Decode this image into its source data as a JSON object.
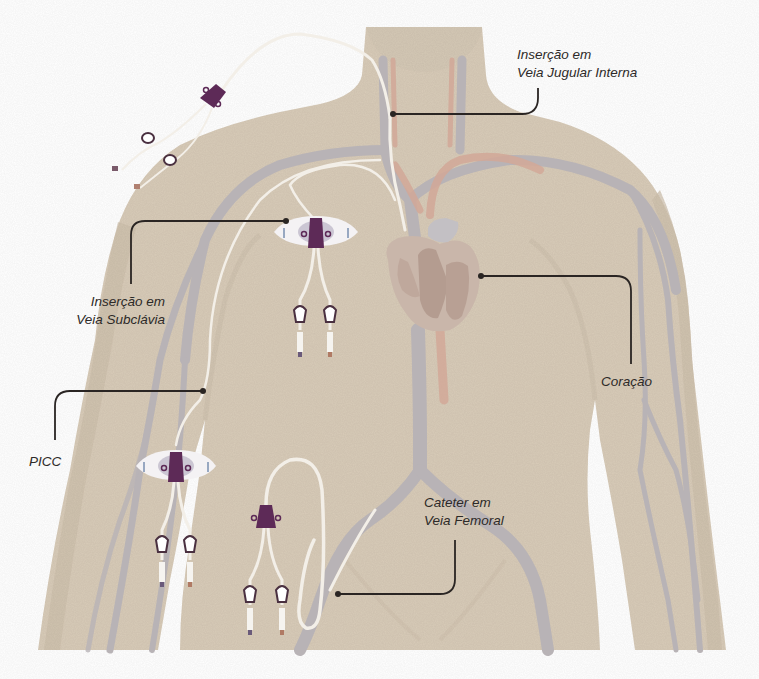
{
  "diagram": {
    "colors": {
      "background": "#ffffff",
      "skin": "#d8cbb8",
      "skin_shadow": "#cdbfab",
      "vein": "#b8b3b6",
      "artery": "#d2a898",
      "heart": "#c4b0a4",
      "heart_dark": "#b49c90",
      "catheter_tube": "#f3efe8",
      "hub_purple": "#5d2a57",
      "dressing": "#f4f2f4",
      "dressing_center": "#cbc6d3",
      "callout_line": "#2a2523",
      "label_text": "#2d2a28"
    },
    "labels": {
      "jugular": {
        "line1": "Inserção em",
        "line2": "Veia Jugular Interna"
      },
      "subclavian": {
        "line1": "Inserção em",
        "line2": "Veia Subclávia"
      },
      "picc": {
        "line1": "PICC"
      },
      "heart": {
        "line1": "Coração"
      },
      "femoral": {
        "line1": "Cateter em",
        "line2": "Veia Femoral"
      }
    },
    "callouts": [
      {
        "id": "jugular",
        "anchor": [
          393,
          114
        ],
        "elbow": [
          538,
          114
        ],
        "end": [
          538,
          88
        ]
      },
      {
        "id": "subclavian",
        "anchor": [
          286,
          221
        ],
        "elbow": [
          131,
          221
        ],
        "end": [
          131,
          284
        ]
      },
      {
        "id": "picc",
        "anchor": [
          203,
          391
        ],
        "elbow": [
          55,
          391
        ],
        "end": [
          55,
          440
        ]
      },
      {
        "id": "heart",
        "anchor": [
          481,
          276
        ],
        "elbow": [
          631,
          276
        ],
        "end": [
          631,
          364
        ]
      },
      {
        "id": "femoral",
        "anchor": [
          338,
          594
        ],
        "elbow": [
          455,
          594
        ],
        "end": [
          455,
          540
        ]
      }
    ],
    "devices": [
      {
        "id": "jugular-catheter-free",
        "type": "double-lumen hub (outside body)"
      },
      {
        "id": "subclavian-catheter",
        "type": "double-lumen with securement dressing"
      },
      {
        "id": "picc-catheter",
        "type": "double-lumen with securement dressing"
      },
      {
        "id": "femoral-catheter",
        "type": "double-lumen hub with looped tube"
      }
    ]
  }
}
